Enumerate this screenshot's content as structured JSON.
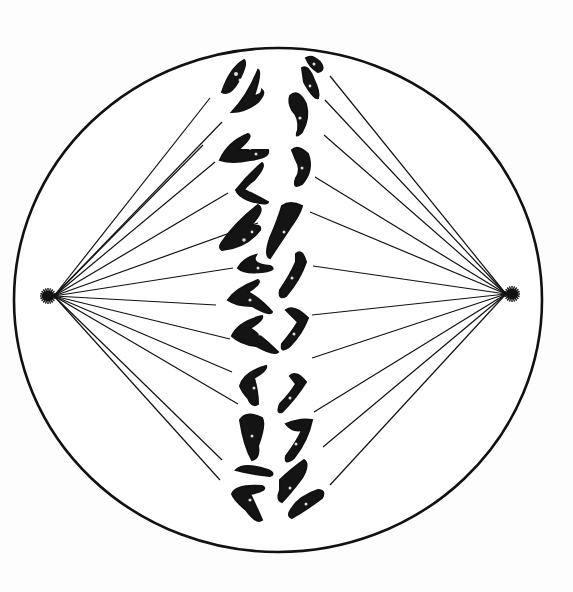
{
  "figure": {
    "colors": {
      "background": "#fdfdfd",
      "ink": "#111111",
      "fill": "#ffffff"
    },
    "cell": {
      "cx": 278,
      "cy": 300,
      "rx": 264,
      "ry": 252
    },
    "poles": {
      "left": {
        "x": 48,
        "y": 296
      },
      "right": {
        "x": 512,
        "y": 294
      }
    },
    "spindle_fibers_left": [
      [
        210,
        98
      ],
      [
        222,
        122
      ],
      [
        203,
        145
      ],
      [
        215,
        162
      ],
      [
        228,
        193
      ],
      [
        258,
        223
      ],
      [
        233,
        268
      ],
      [
        216,
        305
      ],
      [
        230,
        339
      ],
      [
        232,
        372
      ],
      [
        238,
        404
      ],
      [
        220,
        480
      ],
      [
        222,
        460
      ]
    ],
    "spindle_fibers_right": [
      [
        330,
        76
      ],
      [
        325,
        100
      ],
      [
        324,
        135
      ],
      [
        315,
        177
      ],
      [
        310,
        212
      ],
      [
        313,
        266
      ],
      [
        312,
        315
      ],
      [
        312,
        358
      ],
      [
        314,
        412
      ],
      [
        323,
        447
      ],
      [
        330,
        485
      ]
    ]
  }
}
